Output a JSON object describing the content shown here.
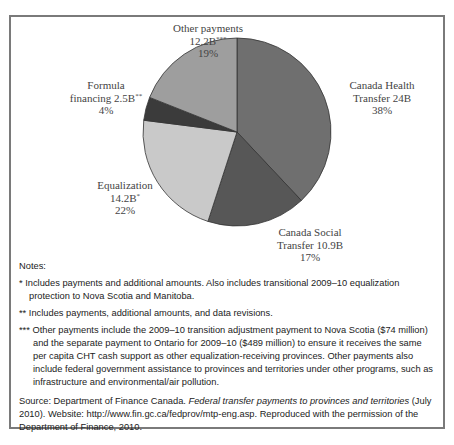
{
  "chart_data": {
    "type": "pie",
    "title": "",
    "start_angle_deg": 0,
    "direction": "clockwise",
    "slices": [
      {
        "name": "Canada Health Transfer",
        "value_billions": 24,
        "value_label": "24B",
        "percent": 38,
        "footnote": "",
        "color": "#6f6f6f"
      },
      {
        "name": "Canada Social Transfer",
        "value_billions": 10.9,
        "value_label": "10.9B",
        "percent": 17,
        "footnote": "",
        "color": "#575757"
      },
      {
        "name": "Equalization",
        "value_billions": 14.2,
        "value_label": "14.2B",
        "percent": 22,
        "footnote": "*",
        "color": "#c9c9c9"
      },
      {
        "name": "Formula financing",
        "value_billions": 2.5,
        "value_label": "2.5B",
        "percent": 4,
        "footnote": "**",
        "color": "#3b3b3b"
      },
      {
        "name": "Other payments",
        "value_billions": 12.2,
        "value_label": "12.2B",
        "percent": 19,
        "footnote": "***",
        "color": "#9e9e9e"
      }
    ],
    "legend": "none (direct labels)"
  },
  "labels": {
    "cht": {
      "line1": "Canada Health",
      "line2": "Transfer 24B",
      "line3": "38%"
    },
    "cst": {
      "line1": "Canada Social",
      "line2": "Transfer 10.9B",
      "line3": "17%"
    },
    "eq": {
      "line1": "Equalization",
      "line2": "14.2B",
      "sup": "*",
      "line3": "22%"
    },
    "ff": {
      "line1": "Formula",
      "line2": "financing 2.5B",
      "sup": "**",
      "line3": "4%"
    },
    "op": {
      "line1": "Other payments",
      "line2": "12.2B",
      "sup": "***",
      "line3": "19%"
    }
  },
  "notes": {
    "heading": "Notes:",
    "n1_mark": "*",
    "n1": "Includes payments and additional amounts. Also includes transitional 2009–10 equalization protection to Nova Scotia and Manitoba.",
    "n2_mark": "**",
    "n2": "Includes payments, additional amounts, and data revisions.",
    "n3_mark": "***",
    "n3": "Other payments include the 2009–10 transition adjustment payment to Nova Scotia ($74 million) and the separate payment to Ontario for 2009–10 ($489 million) to ensure it receives the same per capita CHT cash support as other equalization-receiving provinces. Other payments also include federal government assistance to provinces and territories under other programs, such as infrastructure and environmental/air pollution.",
    "source_prefix": "Source: Department of Finance Canada. ",
    "source_title": "Federal transfer payments to provinces and territories",
    "source_suffix": " (July 2010). Website: http://www.fin.gc.ca/fedprov/mtp-eng.asp. Reproduced with the permission of the Department of Finance, 2010."
  }
}
